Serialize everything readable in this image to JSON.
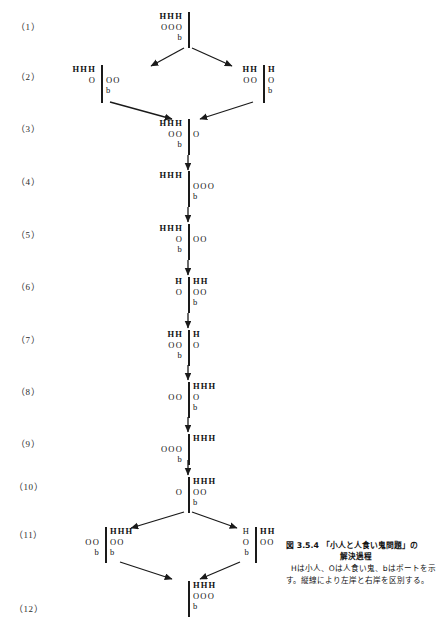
{
  "figure": {
    "title_label": "図 3.5.4",
    "title_text": "「小人と人食い鬼問題」の",
    "title_text2": "解決過程",
    "legend": "Hは小人、Oは人食い鬼、bはボートを示す。縦線により左岸と右岸を区別する。"
  },
  "steps": [
    {
      "label": "（1）",
      "nodes": [
        {
          "left": [
            "HHH",
            "OOO",
            "b"
          ],
          "right": []
        }
      ]
    },
    {
      "label": "（2）",
      "nodes": [
        {
          "left": [
            "HHH",
            "O"
          ],
          "right": [
            "",
            "OO",
            "b"
          ]
        },
        {
          "left": [
            "HH",
            "OO"
          ],
          "right": [
            "H",
            "O",
            "b"
          ]
        }
      ]
    },
    {
      "label": "（3）",
      "nodes": [
        {
          "left": [
            "HHH",
            "OO",
            "b"
          ],
          "right": [
            "",
            "O"
          ]
        }
      ]
    },
    {
      "label": "（4）",
      "nodes": [
        {
          "left": [
            "HHH"
          ],
          "right": [
            "",
            "OOO",
            "b"
          ]
        }
      ]
    },
    {
      "label": "（5）",
      "nodes": [
        {
          "left": [
            "HHH",
            "O",
            "b"
          ],
          "right": [
            "",
            "OO"
          ]
        }
      ]
    },
    {
      "label": "（6）",
      "nodes": [
        {
          "left": [
            "H",
            "O"
          ],
          "right": [
            "HH",
            "OO",
            "b"
          ]
        }
      ]
    },
    {
      "label": "（7）",
      "nodes": [
        {
          "left": [
            "HH",
            "OO",
            "b"
          ],
          "right": [
            "H",
            "O"
          ]
        }
      ]
    },
    {
      "label": "（8）",
      "nodes": [
        {
          "left": [
            "",
            "OO"
          ],
          "right": [
            "HHH",
            "O",
            "b"
          ]
        }
      ]
    },
    {
      "label": "（9）",
      "nodes": [
        {
          "left": [
            "",
            "OOO",
            "b"
          ],
          "right": [
            "HHH"
          ]
        }
      ]
    },
    {
      "label": "（10）",
      "nodes": [
        {
          "left": [
            "",
            "O"
          ],
          "right": [
            "HHH",
            "OO",
            "b"
          ]
        }
      ]
    },
    {
      "label": "（11）",
      "nodes": [
        {
          "left": [
            "",
            "OO",
            "b"
          ],
          "right": [
            "HHH",
            "OO",
            "b"
          ]
        },
        {
          "left": [
            "H",
            "O",
            "b"
          ],
          "right": [
            "HH",
            "OO"
          ]
        }
      ]
    },
    {
      "label": "（12）",
      "nodes": [
        {
          "left": [],
          "right": [
            "HHH",
            "OOO",
            "b"
          ]
        }
      ]
    }
  ],
  "tokens": {
    "human": "H",
    "ogre": "O",
    "boat": "b"
  },
  "colors": {
    "ink": "#1a1a1a",
    "paper": "#ffffff"
  }
}
